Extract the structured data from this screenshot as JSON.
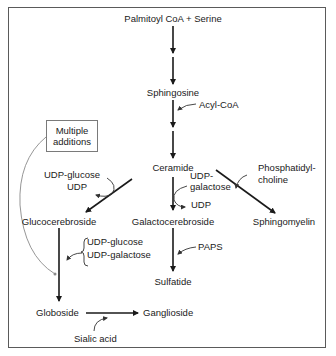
{
  "nodes": {
    "start": "Palmitoyl CoA + Serine",
    "sphingosine": "Sphingosine",
    "ceramide": "Ceramide",
    "glucocerebroside": "Glucocerebroside",
    "galactocerebroside": "Galactocerebroside",
    "sphingomyelin": "Sphingomyelin",
    "sulfatide": "Sulfatide",
    "globoside": "Globoside",
    "ganglioside": "Ganglioside"
  },
  "cofactors": {
    "acyl_coa": "Acyl-CoA",
    "udp_glucose_1": "UDP-glucose",
    "udp_1": "UDP",
    "udp_galactose_line1": "UDP-",
    "udp_galactose_line2": "galactose",
    "udp_2": "UDP",
    "phosphatidylcholine_line1": "Phosphatidyl-",
    "phosphatidylcholine_line2": "choline",
    "paps": "PAPS",
    "udp_glucose_2": "UDP-glucose",
    "udp_galactose_2": "UDP-galactose",
    "sialic_acid": "Sialic acid"
  },
  "callout": {
    "line1": "Multiple",
    "line2": "additions"
  },
  "colors": {
    "arrow": "#1a1a1a",
    "curve": "#8a8a8a",
    "border": "#5a5a5a"
  }
}
